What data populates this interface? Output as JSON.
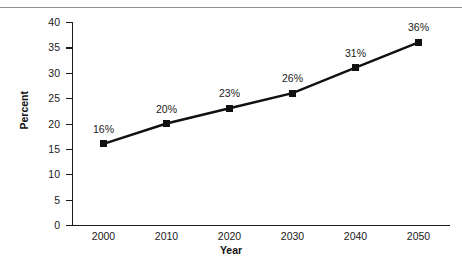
{
  "chart_data": {
    "type": "line",
    "title": "",
    "subtitle": "",
    "xlabel": "Year",
    "ylabel": "Percent",
    "categories": [
      "2000",
      "2010",
      "2020",
      "2030",
      "2040",
      "2050"
    ],
    "x": [
      2000,
      2010,
      2020,
      2030,
      2040,
      2050
    ],
    "values": [
      16,
      20,
      23,
      26,
      31,
      36
    ],
    "point_labels": [
      "16%",
      "20%",
      "23%",
      "26%",
      "31%",
      "36%"
    ],
    "ylim": [
      0,
      40
    ],
    "xlim": [
      1995,
      2055
    ],
    "ytick_labels": [
      "0",
      "5",
      "10",
      "15",
      "20",
      "25",
      "30",
      "35",
      "40"
    ],
    "yticks": [
      0,
      5,
      10,
      15,
      20,
      25,
      30,
      35,
      40
    ],
    "xtick_labels": [
      "2000",
      "2010",
      "2020",
      "2030",
      "2040",
      "2050"
    ],
    "grid": false,
    "legend": null,
    "legend_position": "none",
    "series": [
      {
        "name": "Percent",
        "values": [
          16,
          20,
          23,
          26,
          31,
          36
        ],
        "marker": "square",
        "color": "#111111"
      }
    ],
    "colors": {
      "line": "#111111",
      "marker": "#111111",
      "axis": "#1a1a1a",
      "text": "#1a1a1a",
      "background": "#ffffff",
      "top_rule": "#8f8f8f"
    }
  }
}
